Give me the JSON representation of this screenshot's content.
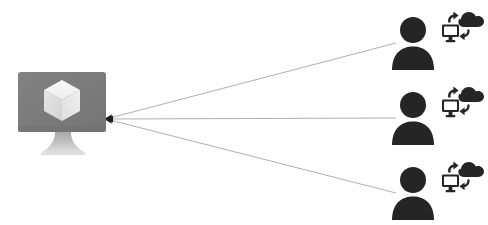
{
  "diagram": {
    "type": "hub-and-spoke",
    "background_color": "#ffffff",
    "central_node": {
      "name": "monitor",
      "icon": "monitor-icon",
      "screen_icon": "cube-icon",
      "label": "",
      "colors": {
        "screen": "#7d7d7d",
        "screen_dark": "#6e6e6e",
        "stand": "#b8b8b8",
        "stand_light": "#d8d8d8",
        "cube_top": "#f2f2f2",
        "cube_left": "#dcdcdc",
        "cube_right": "#e8e8e8"
      },
      "position": {
        "x": 18,
        "y": 72,
        "width": 88,
        "height": 60
      }
    },
    "connector": {
      "name": "connection-lines",
      "color": "#9a9a9a",
      "width": 0.8,
      "arrowhead": {
        "name": "arrowhead-icon",
        "direction": "left",
        "color": "#1f1f1f",
        "x": 106,
        "y": 119
      },
      "lines": [
        {
          "from_x": 106,
          "from_y": 119,
          "to_x": 396,
          "to_y": 43
        },
        {
          "from_x": 106,
          "from_y": 119,
          "to_x": 396,
          "to_y": 118
        },
        {
          "from_x": 106,
          "from_y": 119,
          "to_x": 396,
          "to_y": 193
        }
      ]
    },
    "endpoints": [
      {
        "name": "endpoint-user-1",
        "label": "",
        "color": "#252525",
        "person_icon": "user-icon",
        "sync_icon": "cloud-sync-icon",
        "person_x": 392,
        "person_y": 14,
        "sync_x": 440,
        "sync_y": 8
      },
      {
        "name": "endpoint-user-2",
        "label": "",
        "color": "#252525",
        "person_icon": "user-icon",
        "sync_icon": "cloud-sync-icon",
        "person_x": 392,
        "person_y": 89,
        "sync_x": 440,
        "sync_y": 83
      },
      {
        "name": "endpoint-user-3",
        "label": "",
        "color": "#252525",
        "person_icon": "user-icon",
        "sync_icon": "cloud-sync-icon",
        "person_x": 392,
        "person_y": 164,
        "sync_x": 440,
        "sync_y": 158
      }
    ],
    "captions": []
  }
}
